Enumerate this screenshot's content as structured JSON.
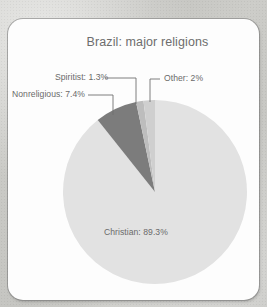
{
  "card": {
    "title": "Brazil: major religions"
  },
  "chart_data": {
    "type": "pie",
    "title": "Brazil: major religions",
    "xlabel": "",
    "ylabel": "",
    "legend_position": "none",
    "grid": false,
    "labels_style": "callout-with-leader-lines",
    "categories": [
      "Christian",
      "Nonreligious",
      "Spiritist",
      "Other"
    ],
    "values": [
      89.3,
      7.4,
      1.3,
      2
    ],
    "units": "percent",
    "slice_labels": [
      "Christian: 89.3%",
      "Nonreligious: 7.4%",
      "Spiritist: 1.3%",
      "Other: 2%"
    ],
    "colors": [
      "#e2e2e2",
      "#7c7c7c",
      "#bdbdbd",
      "#cfcfcf"
    ],
    "start_angle_deg": 0,
    "direction": "clockwise"
  },
  "colors": {
    "page_background": "#c7c7c3",
    "card_background": "#fdfdfd",
    "card_border": "#8a8a8a",
    "text": "#6a6a6a",
    "title_text": "#6d6d6d",
    "leader_line": "#6f6f6f",
    "slice_christian": "#e2e2e2",
    "slice_nonreligious": "#7c7c7c",
    "slice_spiritist": "#bdbdbd",
    "slice_other": "#cfcfcf"
  }
}
